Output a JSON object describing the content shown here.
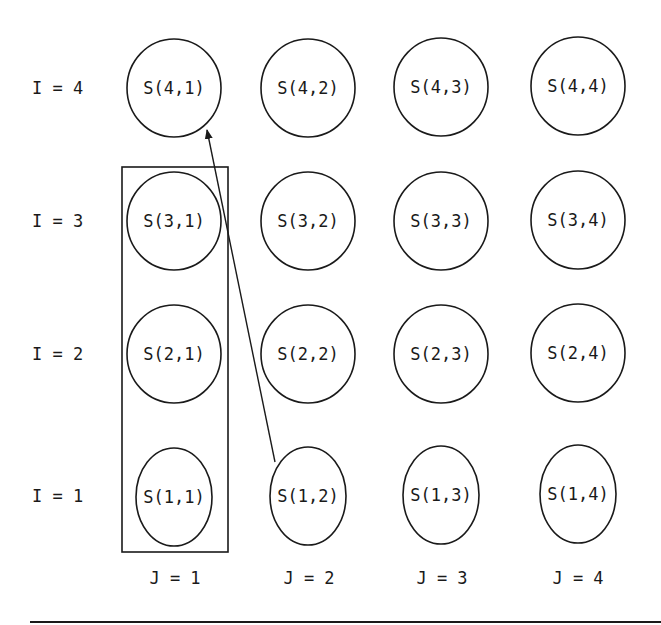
{
  "diagram": {
    "row_labels": [
      "I = 4",
      "I = 3",
      "I = 2",
      "I = 1"
    ],
    "col_labels": [
      "J = 1",
      "J = 2",
      "J = 3",
      "J = 4"
    ],
    "nodes": [
      [
        "S(4,1)",
        "S(4,2)",
        "S(4,3)",
        "S(4,4)"
      ],
      [
        "S(3,1)",
        "S(3,2)",
        "S(3,3)",
        "S(3,4)"
      ],
      [
        "S(2,1)",
        "S(2,2)",
        "S(2,3)",
        "S(2,4)"
      ],
      [
        "S(1,1)",
        "S(1,2)",
        "S(1,3)",
        "S(1,4)"
      ]
    ],
    "highlight_box": {
      "column": "J = 1",
      "rows": [
        "I = 1",
        "I = 2",
        "I = 3"
      ]
    },
    "arrow": {
      "from": "S(1,2)",
      "to": "S(4,1)"
    },
    "colors": {
      "stroke": "#1a1a1a",
      "background": "#ffffff"
    }
  }
}
